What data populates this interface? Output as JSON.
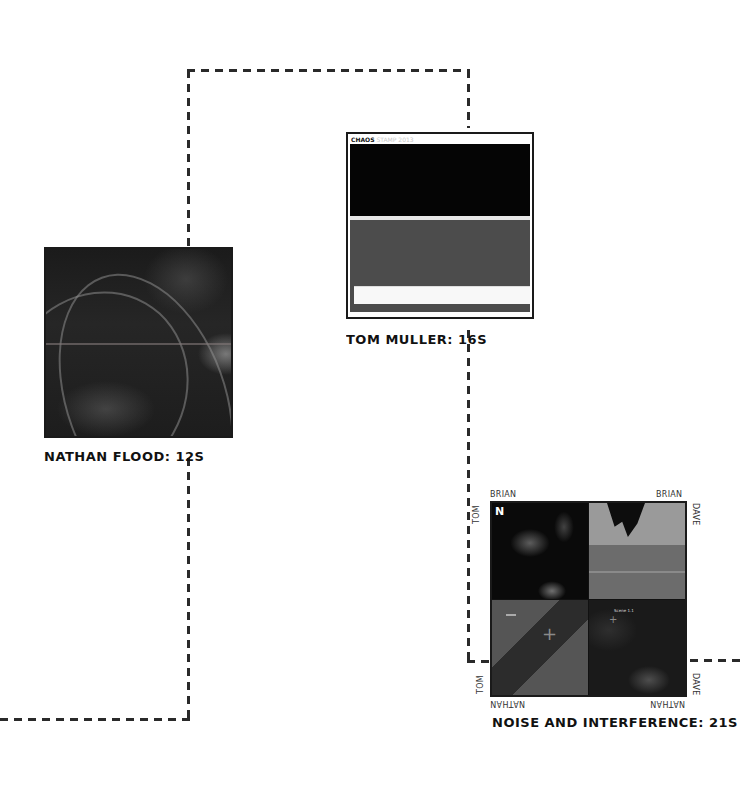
{
  "connectors": {
    "color": "#2a2a2a",
    "style": "dashed"
  },
  "nodes": [
    {
      "id": "nathan-flood",
      "label": "NATHAN FLOOD: 12S",
      "image_description": "dark abstract 3D render with curving strands"
    },
    {
      "id": "tom-muller",
      "label": "TOM MULLER: 16S",
      "window": {
        "title_bold": "CHAOS",
        "title_dim": "STAMP 2013"
      }
    },
    {
      "id": "noise-and-interference",
      "label": "NOISE AND INTERFERENCE: 21S",
      "corners": {
        "top_left": "BRIAN",
        "top_right": "BRIAN",
        "left_top": "TOM",
        "left_bottom": "TOM",
        "right_top": "DAVE",
        "right_bottom": "DAVE",
        "bottom_left": "NATHAN",
        "bottom_right": "NATHAN"
      },
      "logo_glyph": "N",
      "quadrant_tag": "Scene 1.1",
      "colors": {
        "tr_top": "#9a9a9a",
        "tr_band": "#6c6c6c",
        "bl_base": "#555555"
      }
    }
  ]
}
